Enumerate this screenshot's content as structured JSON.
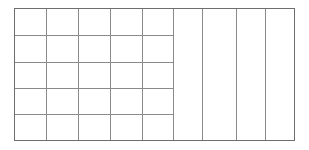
{
  "figure": {
    "kind": "table-grid-outline",
    "title": "",
    "background_color": "#ffffff",
    "line_color": "#8a8a8a",
    "outer_line_color": "#6e6e6e",
    "line_width": 1,
    "bounds": {
      "x": 14,
      "y": 8,
      "width": 280,
      "height": 132
    }
  },
  "left_region": {
    "name": "left-grid",
    "column_count": 5,
    "row_count": 5,
    "x_positions": [
      14,
      46,
      78,
      110,
      142,
      173
    ],
    "y_positions": [
      8,
      35,
      62,
      88,
      114,
      140
    ],
    "rows": [
      {
        "cells": [
          "",
          "",
          "",
          "",
          ""
        ]
      },
      {
        "cells": [
          "",
          "",
          "",
          "",
          ""
        ]
      },
      {
        "cells": [
          "",
          "",
          "",
          "",
          ""
        ]
      },
      {
        "cells": [
          "",
          "",
          "",
          "",
          ""
        ]
      },
      {
        "cells": [
          "",
          "",
          "",
          "",
          ""
        ]
      }
    ]
  },
  "right_region": {
    "name": "right-columns",
    "column_count": 4,
    "x_positions": [
      173,
      202,
      236,
      265,
      294
    ],
    "y_top": 8,
    "y_bottom": 140,
    "columns": [
      {
        "label": ""
      },
      {
        "label": ""
      },
      {
        "label": ""
      },
      {
        "label": ""
      }
    ]
  }
}
